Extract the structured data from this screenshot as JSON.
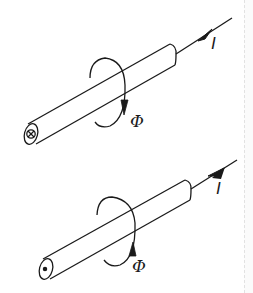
{
  "figure": {
    "stroke_color": "#1a1a1a",
    "background": "#ffffff",
    "panels": [
      {
        "id": "top",
        "current_label": "I",
        "flux_label": "Φ",
        "current_direction": "out-of-end (away from viewer end cap)",
        "end_cap_symbol": "cross (⊗)",
        "arrow_on_wire": "pointing away from conductor"
      },
      {
        "id": "bottom",
        "current_label": "I",
        "flux_label": "Φ",
        "current_direction": "toward end cap (toward viewer)",
        "end_cap_symbol": "dot (⊙)",
        "arrow_on_wire": "pointing toward conductor"
      }
    ]
  }
}
